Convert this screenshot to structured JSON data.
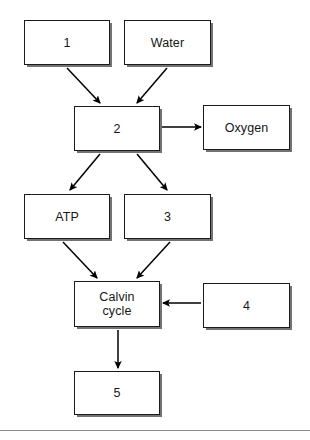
{
  "diagram": {
    "background_color": "#ffffff",
    "box_border_color": "#1b1b1b",
    "box_fill_color": "#ffffff",
    "arrow_color": "#000000",
    "nodes": [
      {
        "id": "input1",
        "label": "1"
      },
      {
        "id": "water",
        "label": "Water"
      },
      {
        "id": "process2",
        "label": "2"
      },
      {
        "id": "oxygen",
        "label": "Oxygen"
      },
      {
        "id": "atp",
        "label": "ATP"
      },
      {
        "id": "product3",
        "label": "3"
      },
      {
        "id": "calvin_cycle",
        "label": "Calvin\ncycle"
      },
      {
        "id": "input4",
        "label": "4"
      },
      {
        "id": "output5",
        "label": "5"
      }
    ],
    "connections": [
      {
        "from": "input1",
        "to": "process2",
        "direction": "down-right"
      },
      {
        "from": "water",
        "to": "process2",
        "direction": "down-left"
      },
      {
        "from": "process2",
        "to": "oxygen",
        "direction": "right"
      },
      {
        "from": "process2",
        "to": "atp",
        "direction": "down-left"
      },
      {
        "from": "process2",
        "to": "product3",
        "direction": "down-right"
      },
      {
        "from": "atp",
        "to": "calvin_cycle",
        "direction": "down-right"
      },
      {
        "from": "product3",
        "to": "calvin_cycle",
        "direction": "down-left"
      },
      {
        "from": "input4",
        "to": "calvin_cycle",
        "direction": "left"
      },
      {
        "from": "calvin_cycle",
        "to": "output5",
        "direction": "down"
      }
    ]
  }
}
